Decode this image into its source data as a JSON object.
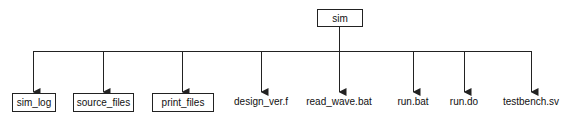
{
  "root": {
    "label": "sim",
    "type": "folder"
  },
  "children": [
    {
      "label": "sim_log",
      "type": "folder"
    },
    {
      "label": "source_files",
      "type": "folder"
    },
    {
      "label": "print_files",
      "type": "folder"
    },
    {
      "label": "design_ver.f",
      "type": "file"
    },
    {
      "label": "read_wave.bat",
      "type": "file"
    },
    {
      "label": "run.bat",
      "type": "file"
    },
    {
      "label": "run.do",
      "type": "file"
    },
    {
      "label": "testbench.sv",
      "type": "file"
    }
  ],
  "colors": {
    "line": "#222222",
    "background": "#ffffff",
    "text": "#111111"
  }
}
